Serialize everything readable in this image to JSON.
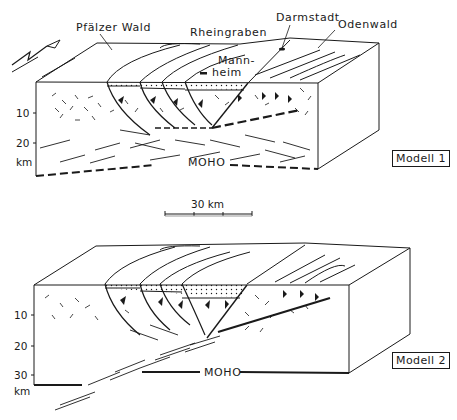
{
  "diagram": {
    "type": "geological-block-diagram",
    "colors": {
      "ink": "#1a1a1a",
      "background": "#ffffff"
    }
  },
  "top_block": {
    "labels": {
      "pfaelzer_wald": "Pfälzer Wald",
      "rheingraben": "Rheingraben",
      "darmstadt": "Darmstadt",
      "odenwald": "Odenwald",
      "mannheim": "Mann-\nheim",
      "mannheim_line1": "Mann-",
      "mannheim_line2": "heim",
      "moho": "MOHO"
    },
    "depth_axis": {
      "ticks": [
        "10",
        "20"
      ],
      "unit": "km"
    },
    "model_label": "Modell 1"
  },
  "scale_bar": {
    "label": "30 km"
  },
  "bottom_block": {
    "labels": {
      "moho": "MOHO"
    },
    "depth_axis": {
      "ticks": [
        "10",
        "20",
        "30"
      ],
      "unit": "km"
    },
    "model_label": "Modell 2"
  }
}
